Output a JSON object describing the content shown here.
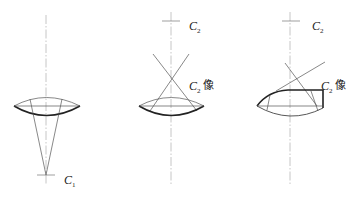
{
  "figure": {
    "panels": [
      {
        "id": "left",
        "label": {
          "letter": "C",
          "sub": "1",
          "suffix": ""
        }
      },
      {
        "id": "middle",
        "label_top": {
          "letter": "C",
          "sub": "2",
          "suffix": ""
        },
        "label_image": {
          "letter": "C",
          "sub": "2",
          "suffix": "像"
        }
      },
      {
        "id": "right",
        "label_top": {
          "letter": "C",
          "sub": "2",
          "suffix": ""
        },
        "label_image": {
          "letter": "C",
          "sub": "2",
          "suffix": "像"
        }
      }
    ]
  }
}
